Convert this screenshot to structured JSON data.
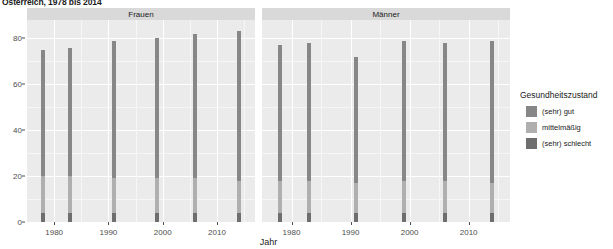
{
  "title": "Österreich, 1978 bis 2014",
  "axis": {
    "xlabel": "Jahr",
    "ylabel": "",
    "yticks": [
      0,
      20,
      40,
      60,
      80
    ],
    "xticks": [
      1980,
      1990,
      2000,
      2010
    ],
    "ylim": [
      0,
      88
    ],
    "xlim": [
      1975,
      2017
    ]
  },
  "legend": {
    "title": "Gesundheitszustand",
    "position": "right",
    "items": [
      {
        "label": "(sehr) gut",
        "color": "#878787"
      },
      {
        "label": "mittelmäßig",
        "color": "#afafaf"
      },
      {
        "label": "(sehr) schlecht",
        "color": "#6e6e6e"
      }
    ]
  },
  "panels": [
    {
      "label": "Frauen"
    },
    {
      "label": "Männer"
    }
  ],
  "colors": {
    "panel_bg": "#ebebeb",
    "strip_bg": "#d9d9d9",
    "grid_major": "#ffffff",
    "grid_minor": "#f6f6f6",
    "text": "#1a1a1a",
    "axis_text": "#4d4d4d"
  },
  "chart_data": {
    "type": "bar",
    "title": "Österreich, 1978 bis 2014",
    "xlabel": "Jahr",
    "ylabel": "",
    "ylim": [
      0,
      88
    ],
    "xlim": [
      1975,
      2017
    ],
    "grid": true,
    "stacked": true,
    "facets": [
      "Frauen",
      "Männer"
    ],
    "legend_title": "Gesundheitszustand",
    "series": [
      {
        "name": "(sehr) gut",
        "color": "#878787"
      },
      {
        "name": "mittelmäßig",
        "color": "#afafaf"
      },
      {
        "name": "(sehr) schlecht",
        "color": "#6e6e6e"
      }
    ],
    "panels": [
      {
        "name": "Frauen",
        "x": [
          1978,
          1983,
          1991,
          1999,
          2006,
          2014
        ],
        "values": {
          "(sehr) gut": [
            55,
            56,
            60,
            61,
            63,
            65
          ],
          "mittelmäßig": [
            16,
            16,
            15,
            15,
            15,
            14
          ],
          "(sehr) schlecht": [
            4,
            4,
            4,
            4,
            4,
            4
          ]
        },
        "totals": [
          75,
          76,
          79,
          80,
          82,
          83
        ]
      },
      {
        "name": "Männer",
        "x": [
          1978,
          1983,
          1991,
          1999,
          2006,
          2014
        ],
        "values": {
          "(sehr) gut": [
            59,
            60,
            55,
            61,
            60,
            62
          ],
          "mittelmäßig": [
            14,
            14,
            13,
            14,
            14,
            13
          ],
          "(sehr) schlecht": [
            4,
            4,
            4,
            4,
            4,
            4
          ]
        },
        "totals": [
          77,
          78,
          72,
          79,
          78,
          79
        ]
      }
    ]
  }
}
